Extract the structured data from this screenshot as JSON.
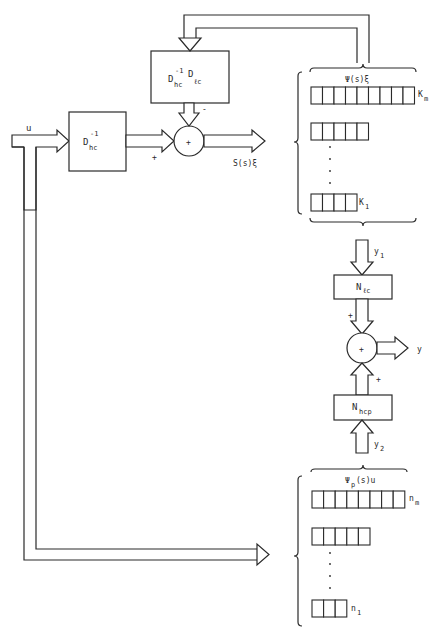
{
  "diagram": {
    "type": "block-diagram",
    "input": {
      "label": "u"
    },
    "blocks": {
      "inv_dhc": {
        "main": "D",
        "sup": "-1",
        "sub": "hc"
      },
      "feedback": {
        "main1": "D",
        "sup1": "-1",
        "sub1": "hc",
        "main2": "D",
        "sub2": "ℓc"
      },
      "n_lc": {
        "main": "N",
        "sub": "ℓc"
      },
      "n_hcp": {
        "main": "N",
        "sub": "hcp"
      }
    },
    "summing_junctions": {
      "top": {
        "symbol": "+",
        "input_signs": {
          "left": "+",
          "top": "-"
        },
        "output": "S(s)ξ"
      },
      "bottom": {
        "symbol": "+",
        "input_signs": {
          "top": "+",
          "bottom": "+"
        },
        "output": "y"
      }
    },
    "register_stacks": {
      "upper": {
        "title": "Ψ(s)ξ",
        "rows": [
          {
            "cells": 9,
            "label_main": "K",
            "label_sub": "m"
          },
          {
            "cells": 5
          },
          {
            "cells": 4,
            "label_main": "K",
            "label_sub": "1"
          }
        ],
        "output": {
          "main": "y",
          "sub": "1"
        }
      },
      "lower": {
        "title_main": "Ψ",
        "title_sub": "p",
        "title_rest": "(s)u",
        "rows": [
          {
            "cells": 8,
            "label_main": "n",
            "label_sub": "m"
          },
          {
            "cells": 5
          },
          {
            "cells": 3,
            "label_main": "n",
            "label_sub": "1"
          }
        ],
        "output": {
          "main": "y",
          "sub": "2"
        }
      }
    }
  }
}
